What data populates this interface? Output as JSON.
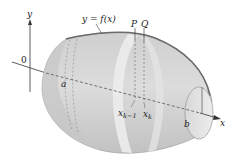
{
  "figure": {
    "type": "solid-of-revolution",
    "colors": {
      "background": "#ffffff",
      "solid_fill": "#d4d4d4",
      "solid_shade": "#bdbdbd",
      "highlight_band": "#e6e6e6",
      "curve": "#6b6b6b",
      "axis": "#333333",
      "text": "#222222"
    },
    "labels": {
      "y_axis": "y",
      "x_axis": "x",
      "origin": "0",
      "curve": "y = f(x)",
      "point_p": "P",
      "point_q": "Q",
      "a": "a",
      "b": "b",
      "xk_minus_1_base": "x",
      "xk_minus_1_sub": "k−1",
      "xk_base": "x",
      "xk_sub": "k"
    }
  }
}
